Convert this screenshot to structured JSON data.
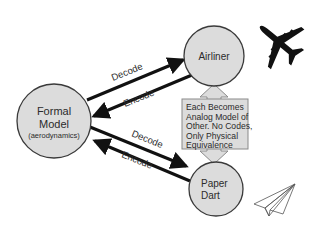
{
  "diagram": {
    "colors": {
      "node_fill": "#dcdcdc",
      "node_stroke": "#3a3a3a",
      "arrow": "#111111",
      "box_fill": "#dcdcdc",
      "box_stroke": "#8a8a8a",
      "text": "#2b2b2b"
    },
    "nodes": {
      "formal_model": {
        "line1": "Formal",
        "line2": "Model",
        "line3": "(aerodynamics)"
      },
      "airliner": {
        "label": "Airliner"
      },
      "paper_dart": {
        "line1": "Paper",
        "line2": "Dart"
      }
    },
    "edges": {
      "top_decode": "Decode",
      "top_encode": "Encode",
      "bottom_decode": "Decode",
      "bottom_encode": "Encode"
    },
    "equivalence_box": {
      "lines": [
        "Each Becomes",
        "Analog Model of",
        "Other. No Codes,",
        "Only Physical",
        "Equivalence"
      ]
    },
    "icons": {
      "airliner": "airplane-silhouette-icon",
      "paper_dart": "paper-airplane-outline-icon"
    }
  }
}
